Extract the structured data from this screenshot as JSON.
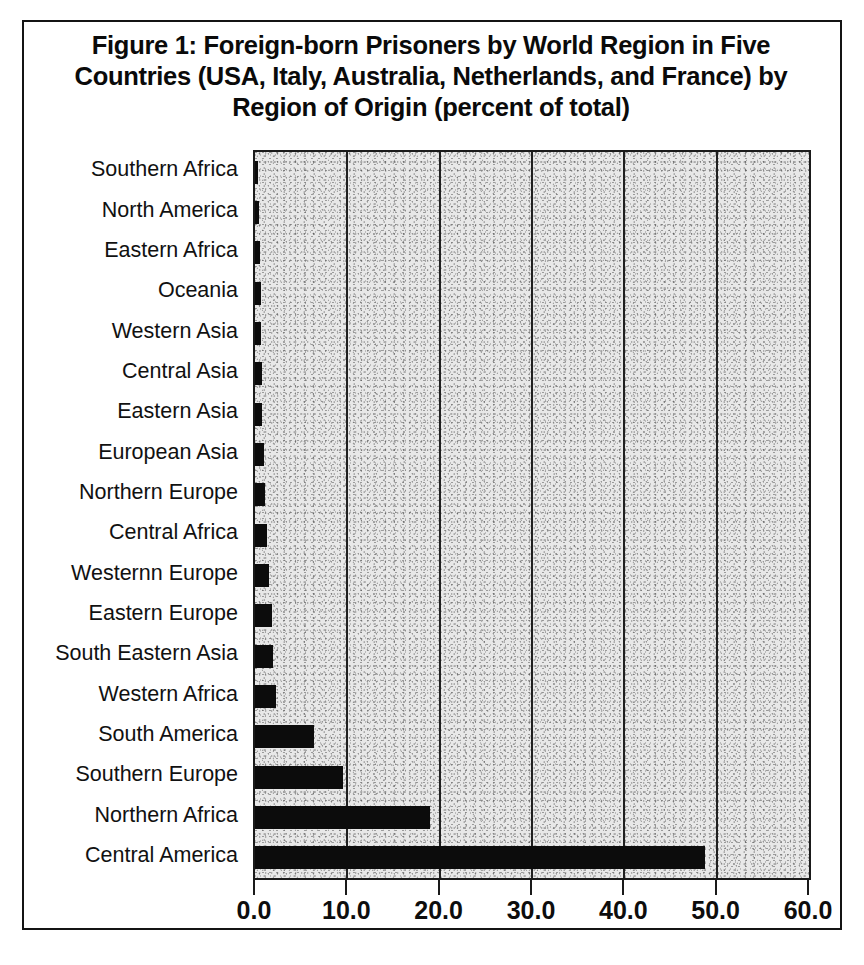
{
  "figure": {
    "title": "Figure 1: Foreign-born Prisoners by World Region in Five Countries (USA, Italy, Australia, Netherlands, and France) by Region of Origin (percent of total)"
  },
  "chart_data": {
    "type": "bar",
    "orientation": "horizontal",
    "title": "Figure 1: Foreign-born Prisoners by World Region in Five Countries (USA, Italy, Australia, Netherlands, and France) by Region of Origin (percent of total)",
    "xlabel": "",
    "ylabel": "",
    "xlim": [
      0.0,
      60.0
    ],
    "xticks": [
      0.0,
      10.0,
      20.0,
      30.0,
      40.0,
      50.0,
      60.0
    ],
    "xtick_labels": [
      "0.0",
      "10.0",
      "20.0",
      "30.0",
      "40.0",
      "50.0",
      "60.0"
    ],
    "grid": "vertical",
    "legend": "none",
    "bar_color": "#0c0c0c",
    "plot_background": "#e8e8e8",
    "categories": [
      "Southern Africa",
      "North America",
      "Eastern Africa",
      "Oceania",
      "Western Asia",
      "Central Asia",
      "Eastern Asia",
      "European Asia",
      "Northern Europe",
      "Central Africa",
      "Westernn Europe",
      "Eastern Europe",
      "South Eastern Asia",
      "Western Africa",
      "South America",
      "Southern Europe",
      "Northern Africa",
      "Central America"
    ],
    "values": [
      0.3,
      0.4,
      0.5,
      0.6,
      0.7,
      0.8,
      0.8,
      1.0,
      1.1,
      1.3,
      1.5,
      1.8,
      1.9,
      2.3,
      6.4,
      9.5,
      18.9,
      48.7
    ],
    "units": "percent of total"
  }
}
